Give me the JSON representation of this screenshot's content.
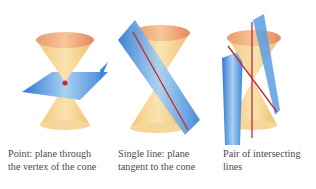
{
  "figures": [
    {
      "id": "point",
      "caption_line1": "Point: plane through",
      "caption_line2": "the vertex of the cone"
    },
    {
      "id": "single-line",
      "caption_line1": "Single line: plane",
      "caption_line2": "tangent to the cone"
    },
    {
      "id": "intersecting-lines",
      "caption_line1": "Pair of intersecting",
      "caption_line2": "lines"
    }
  ],
  "colors": {
    "cone": "#f5d08a",
    "cone_rim": "#e8906a",
    "plane": "#3f88d8",
    "line": "#c8262a"
  }
}
